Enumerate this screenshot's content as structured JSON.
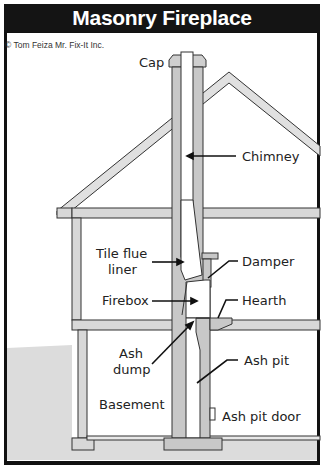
{
  "title": "Masonry Fireplace",
  "credit": "© Tom Feiza Mr. Fix-It Inc.",
  "labels": {
    "cap": "Cap",
    "chimney": "Chimney",
    "tile_flue_liner_1": "Tile flue",
    "tile_flue_liner_2": "liner",
    "damper": "Damper",
    "firebox": "Firebox",
    "hearth": "Hearth",
    "ash_dump_1": "Ash",
    "ash_dump_2": "dump",
    "ash_pit": "Ash pit",
    "basement": "Basement",
    "ash_pit_door": "Ash pit door"
  },
  "colors": {
    "masonry": "#c8c8c8",
    "outline": "#333333",
    "ground": "#dcdcdc",
    "title_bg": "#141414"
  }
}
